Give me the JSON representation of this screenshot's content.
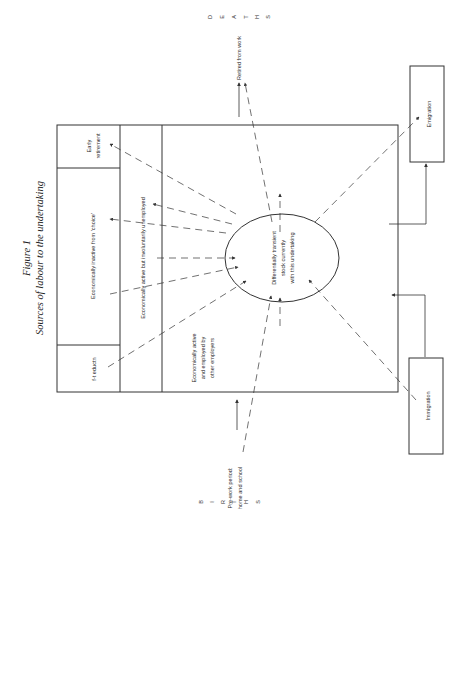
{
  "figure": {
    "number": "Figure 1",
    "title": "Sources of labour to the undertaking"
  },
  "main_box": {
    "compartments": [
      {
        "id": "ft-education",
        "label": "f-t eductn"
      },
      {
        "id": "inactive",
        "label": "Economically inactive from 'choice'"
      },
      {
        "id": "early-retirement",
        "label_lines": [
          "Early",
          "retirement"
        ]
      },
      {
        "id": "unemployed",
        "label": "Economically active but involuntarily unemployed"
      },
      {
        "id": "employed-elsewhere",
        "label_lines": [
          "Economically active",
          "and employed by",
          "other employers"
        ]
      }
    ]
  },
  "stock": {
    "label_lines": [
      "Differentially transient",
      "stock currently",
      "with this undertaking"
    ]
  },
  "external": {
    "emigration": "Emigration",
    "immigration": "Immigration",
    "retired": "Retired from work",
    "prework_lines": [
      "Pre-work period:",
      "home and school"
    ],
    "deaths_letters": [
      "D",
      "E",
      "A",
      "T",
      "H",
      "S"
    ],
    "births_letters": [
      "B",
      "I",
      "R",
      "T",
      "H",
      "S"
    ]
  }
}
